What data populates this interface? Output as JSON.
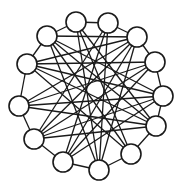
{
  "diagram": {
    "type": "circulant-graph",
    "node_radius": 10,
    "colors": {
      "stroke": "#1a1a1a",
      "fill": "#ffffff",
      "background": "#ffffff"
    },
    "hub": {
      "x": 91,
      "y": 97
    },
    "nodes": [
      {
        "id": 1,
        "x": 76,
        "y": 22
      },
      {
        "id": 2,
        "x": 108,
        "y": 23
      },
      {
        "id": 3,
        "x": 137,
        "y": 37
      },
      {
        "id": 4,
        "x": 155,
        "y": 62
      },
      {
        "id": 5,
        "x": 163,
        "y": 96
      },
      {
        "id": 6,
        "x": 156,
        "y": 126
      },
      {
        "id": 7,
        "x": 131,
        "y": 154
      },
      {
        "id": 8,
        "x": 99,
        "y": 170
      },
      {
        "id": 9,
        "x": 63,
        "y": 162
      },
      {
        "id": 10,
        "x": 34,
        "y": 139
      },
      {
        "id": 11,
        "x": 19,
        "y": 106
      },
      {
        "id": 12,
        "x": 27,
        "y": 64
      },
      {
        "id": 13,
        "x": 47,
        "y": 36
      }
    ],
    "edges": [
      [
        1,
        2
      ],
      [
        2,
        3
      ],
      [
        3,
        4
      ],
      [
        4,
        5
      ],
      [
        5,
        6
      ],
      [
        6,
        7
      ],
      [
        7,
        8
      ],
      [
        8,
        9
      ],
      [
        9,
        10
      ],
      [
        10,
        11
      ],
      [
        11,
        12
      ],
      [
        12,
        13
      ],
      [
        13,
        1
      ],
      [
        1,
        6
      ],
      [
        1,
        7
      ],
      [
        1,
        8
      ],
      [
        2,
        8
      ],
      [
        2,
        9
      ],
      [
        2,
        10
      ],
      [
        3,
        9
      ],
      [
        3,
        10
      ],
      [
        3,
        11
      ],
      [
        3,
        12
      ],
      [
        3,
        13
      ],
      [
        4,
        10
      ],
      [
        4,
        11
      ],
      [
        4,
        12
      ],
      [
        5,
        11
      ],
      [
        5,
        12
      ],
      [
        5,
        13
      ],
      [
        6,
        12
      ],
      [
        6,
        13
      ],
      [
        6,
        11
      ],
      [
        7,
        13
      ],
      [
        7,
        12
      ],
      [
        8,
        13
      ],
      [
        8,
        3
      ],
      [
        9,
        4
      ],
      [
        9,
        5
      ],
      [
        10,
        5
      ],
      [
        10,
        6
      ],
      [
        11,
        6
      ],
      [
        12,
        7
      ],
      [
        13,
        8
      ]
    ]
  }
}
